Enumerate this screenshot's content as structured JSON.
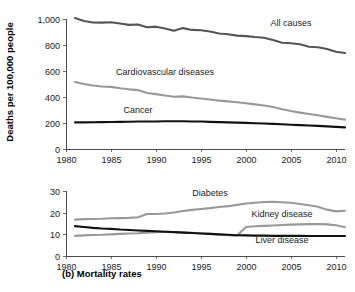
{
  "figure": {
    "caption": "(b) Mortality rates",
    "colors": {
      "dark": "#555555",
      "medium": "#999999",
      "black": "#111111",
      "axis": "#555555",
      "background": "#ffffff"
    }
  },
  "chart_data": [
    {
      "type": "line",
      "panel": "top",
      "title": "",
      "xlabel": "",
      "ylabel": "Deaths per 100,000 people",
      "xlim": [
        1980,
        2011
      ],
      "ylim": [
        0,
        1000
      ],
      "grid": false,
      "legend_position": "inline-annotations",
      "xticks": [
        1980,
        1985,
        1990,
        1995,
        2000,
        2005,
        2010
      ],
      "xticklabels": [
        "1980",
        "1985",
        "1990",
        "1995",
        "2000",
        "2005",
        "2010"
      ],
      "yticks": [
        0,
        200,
        400,
        600,
        800,
        1000
      ],
      "yticklabels": [
        "0",
        "200",
        "400",
        "600",
        "800",
        "1,000"
      ],
      "x": [
        1981,
        1982,
        1983,
        1984,
        1985,
        1986,
        1987,
        1988,
        1989,
        1990,
        1991,
        1992,
        1993,
        1994,
        1995,
        1996,
        1997,
        1998,
        1999,
        2000,
        2001,
        2002,
        2003,
        2004,
        2005,
        2006,
        2007,
        2008,
        2009,
        2010,
        2011
      ],
      "series": [
        {
          "name": "All causes",
          "color": "#555555",
          "label_x": 2005,
          "label_y": 945,
          "values": [
            1007,
            985,
            973,
            972,
            975,
            965,
            955,
            958,
            937,
            941,
            927,
            910,
            930,
            916,
            913,
            904,
            888,
            883,
            872,
            868,
            861,
            856,
            838,
            817,
            813,
            806,
            787,
            783,
            769,
            748,
            738
          ]
        },
        {
          "name": "Cardiovascular diseases",
          "color": "#999999",
          "label_x": 1991,
          "label_y": 570,
          "values": [
            515,
            500,
            489,
            481,
            478,
            467,
            459,
            453,
            431,
            422,
            411,
            402,
            405,
            396,
            389,
            381,
            372,
            366,
            359,
            352,
            343,
            335,
            323,
            306,
            292,
            280,
            269,
            259,
            247,
            236,
            226
          ]
        },
        {
          "name": "Cancer",
          "color": "#111111",
          "label_x": 1988,
          "label_y": 275,
          "values": [
            205,
            205,
            206,
            207,
            208,
            209,
            210,
            211,
            212,
            212,
            213,
            213,
            213,
            212,
            211,
            209,
            207,
            205,
            203,
            201,
            198,
            196,
            193,
            190,
            187,
            184,
            181,
            178,
            174,
            170,
            166
          ]
        }
      ]
    },
    {
      "type": "line",
      "panel": "bottom",
      "title": "",
      "xlabel": "",
      "ylabel": "",
      "xlim": [
        1980,
        2011
      ],
      "ylim": [
        0,
        30
      ],
      "grid": false,
      "legend_position": "inline-annotations",
      "xticks": [
        1980,
        1985,
        1990,
        1995,
        2000,
        2005,
        2010
      ],
      "xticklabels": [
        "1980",
        "1985",
        "1990",
        "1995",
        "2000",
        "2005",
        "2010"
      ],
      "yticks": [
        0,
        10,
        20,
        30
      ],
      "yticklabels": [
        "0",
        "10",
        "20",
        "30"
      ],
      "x": [
        1981,
        1982,
        1983,
        1984,
        1985,
        1986,
        1987,
        1988,
        1989,
        1990,
        1991,
        1992,
        1993,
        1994,
        1995,
        1996,
        1997,
        1998,
        1999,
        2000,
        2001,
        2002,
        2003,
        2004,
        2005,
        2006,
        2007,
        2008,
        2009,
        2010,
        2011
      ],
      "series": [
        {
          "name": "Diabetes",
          "color": "#999999",
          "label_x": 1996,
          "label_y": 27.5,
          "values": [
            16.8,
            17.0,
            17.1,
            17.2,
            17.4,
            17.5,
            17.6,
            17.9,
            19.4,
            19.4,
            19.6,
            20.1,
            20.8,
            21.3,
            21.7,
            22.1,
            22.6,
            23.0,
            23.6,
            24.2,
            24.6,
            24.9,
            25.0,
            24.8,
            24.6,
            24.0,
            23.4,
            22.7,
            21.4,
            20.6,
            20.9
          ]
        },
        {
          "name": "Kidney disease",
          "color": "#999999",
          "label_x": 2004,
          "label_y": 18.0,
          "values": [
            9.3,
            9.5,
            9.7,
            9.8,
            10.0,
            10.2,
            10.4,
            10.5,
            10.8,
            11.0,
            11.2,
            11.1,
            10.9,
            10.7,
            10.5,
            10.2,
            9.9,
            9.6,
            9.4,
            13.4,
            13.7,
            13.9,
            14.1,
            14.3,
            14.5,
            14.6,
            14.7,
            14.8,
            14.6,
            14.2,
            13.3
          ]
        },
        {
          "name": "Liver disease",
          "color": "#111111",
          "label_x": 2004,
          "label_y": 6.0,
          "values": [
            13.8,
            13.4,
            13.0,
            12.7,
            12.5,
            12.2,
            12.0,
            11.8,
            11.6,
            11.4,
            11.2,
            11.0,
            10.8,
            10.6,
            10.4,
            10.2,
            10.0,
            9.8,
            9.6,
            9.5,
            9.4,
            9.4,
            9.3,
            9.3,
            9.3,
            9.3,
            9.2,
            9.2,
            9.2,
            9.2,
            9.2
          ]
        }
      ]
    }
  ]
}
